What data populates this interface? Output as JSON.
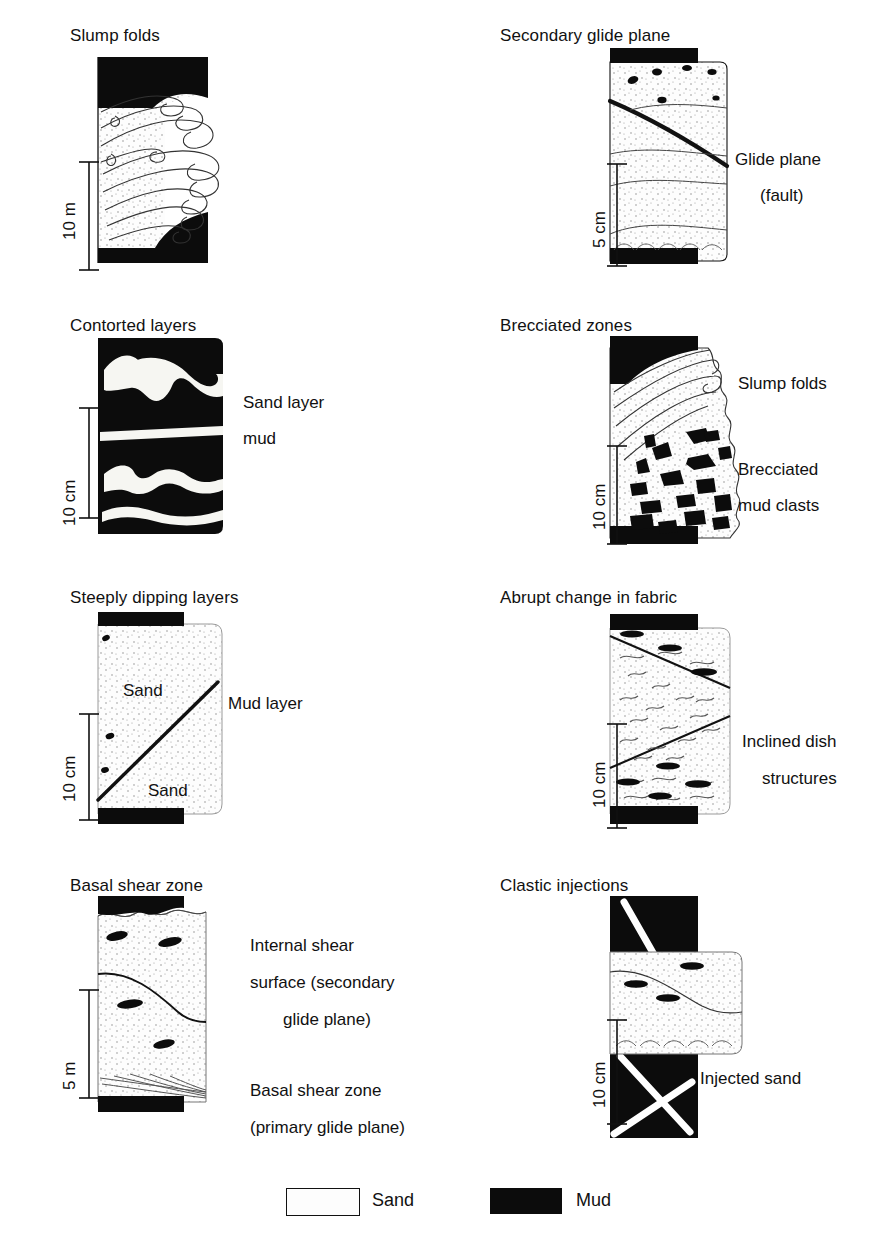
{
  "figure": {
    "kind": "geological-diagram",
    "colors": {
      "mud": "#0c0c0c",
      "sand": "#fdfdfd",
      "line": "#111111",
      "stipple": "#9a9a9a"
    }
  },
  "panels": [
    {
      "id": "slump-folds",
      "title": "Slump folds",
      "scale": "10 m",
      "labels": []
    },
    {
      "id": "secondary-glide-plane",
      "title": "Secondary glide plane",
      "scale": "5 cm",
      "labels": [
        {
          "text": "Glide plane",
          "x": 735,
          "y": 146
        },
        {
          "text": "(fault)",
          "x": 760,
          "y": 182
        }
      ]
    },
    {
      "id": "contorted-layers",
      "title": "Contorted layers",
      "scale": "10 cm",
      "labels": [
        {
          "text": "Sand layer",
          "x": 243,
          "y": 389
        },
        {
          "text": "mud",
          "x": 243,
          "y": 425
        }
      ]
    },
    {
      "id": "brecciated-zones",
      "title": "Brecciated zones",
      "scale": "10 cm",
      "labels": [
        {
          "text": "Slump folds",
          "x": 738,
          "y": 370
        },
        {
          "text": "Brecciated",
          "x": 738,
          "y": 456
        },
        {
          "text": "mud clasts",
          "x": 738,
          "y": 492
        }
      ]
    },
    {
      "id": "steeply-dipping-layers",
      "title": "Steeply dipping layers",
      "scale": "10 cm",
      "labels": [
        {
          "text": "Mud layer",
          "x": 258,
          "y": 705
        },
        {
          "text": "Sand",
          "x": 143,
          "y": 690
        },
        {
          "text": "Sand",
          "x": 165,
          "y": 790
        }
      ]
    },
    {
      "id": "abrupt-change-in-fabric",
      "title": "Abrupt change in fabric",
      "scale": "10 cm",
      "labels": [
        {
          "text": "Inclined dish",
          "x": 742,
          "y": 728
        },
        {
          "text": "structures",
          "x": 762,
          "y": 765
        }
      ]
    },
    {
      "id": "basal-shear-zone",
      "title": "Basal shear zone",
      "scale": "5 m",
      "labels": [
        {
          "text": "Internal shear",
          "x": 250,
          "y": 943
        },
        {
          "text": "surface (secondary",
          "x": 250,
          "y": 980
        },
        {
          "text": "glide plane)",
          "x": 283,
          "y": 1017
        },
        {
          "text": "Basal shear zone",
          "x": 250,
          "y": 1088
        },
        {
          "text": "(primary glide plane)",
          "x": 250,
          "y": 1125
        }
      ]
    },
    {
      "id": "clastic-injections",
      "title": "Clastic injections",
      "scale": "10 cm",
      "labels": [
        {
          "text": "Injected sand",
          "x": 700,
          "y": 1078
        }
      ]
    }
  ],
  "legend": {
    "items": [
      {
        "key": "sand",
        "label": "Sand",
        "swatch": "sand"
      },
      {
        "key": "mud",
        "label": "Mud",
        "swatch": "mud"
      }
    ]
  },
  "titles": {
    "p1": "Slump folds",
    "p2": "Secondary glide plane",
    "p3": "Contorted layers",
    "p4": "Brecciated zones",
    "p5": "Steeply dipping layers",
    "p6": "Abrupt change in fabric",
    "p7": "Basal shear zone",
    "p8": "Clastic injections"
  },
  "scales": {
    "p1": "10 m",
    "p2": "5 cm",
    "p3": "10 cm",
    "p4": "10 cm",
    "p5": "10 cm",
    "p6": "10 cm",
    "p7": "5 m",
    "p8": "10 cm"
  }
}
